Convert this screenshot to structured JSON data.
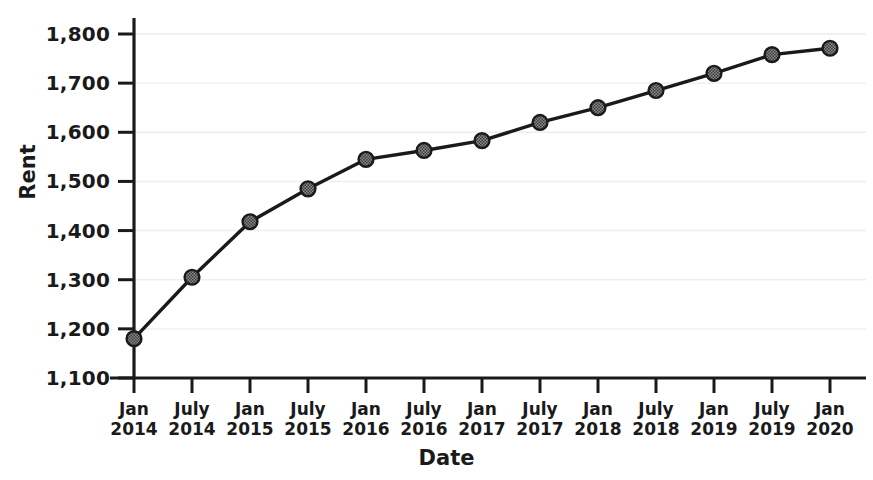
{
  "chart_data": {
    "type": "line",
    "title": "",
    "xlabel": "Date",
    "ylabel": "Rent",
    "categories": [
      "Jan 2014",
      "July 2014",
      "Jan 2015",
      "July 2015",
      "Jan 2016",
      "July 2016",
      "Jan 2017",
      "July 2017",
      "Jan 2018",
      "July 2018",
      "Jan 2019",
      "July 2019",
      "Jan 2020"
    ],
    "x_tick_labels": [
      {
        "line1": "Jan",
        "line2": "2014"
      },
      {
        "line1": "July",
        "line2": "2014"
      },
      {
        "line1": "Jan",
        "line2": "2015"
      },
      {
        "line1": "July",
        "line2": "2015"
      },
      {
        "line1": "Jan",
        "line2": "2016"
      },
      {
        "line1": "July",
        "line2": "2016"
      },
      {
        "line1": "Jan",
        "line2": "2017"
      },
      {
        "line1": "July",
        "line2": "2017"
      },
      {
        "line1": "Jan",
        "line2": "2018"
      },
      {
        "line1": "July",
        "line2": "2018"
      },
      {
        "line1": "Jan",
        "line2": "2019"
      },
      {
        "line1": "July",
        "line2": "2019"
      },
      {
        "line1": "Jan",
        "line2": "2020"
      }
    ],
    "values": [
      1180,
      1305,
      1418,
      1485,
      1545,
      1563,
      1583,
      1620,
      1650,
      1685,
      1720,
      1758,
      1771
    ],
    "y_tick_labels": [
      "1,800",
      "1,700",
      "1,600",
      "1,500",
      "1,400",
      "1,300",
      "1,200",
      "1,100"
    ],
    "y_tick_values": [
      1800,
      1700,
      1600,
      1500,
      1400,
      1300,
      1200,
      1100
    ],
    "ylim": [
      1100,
      1800
    ],
    "grid": true,
    "legend": "none",
    "series": [
      {
        "name": "Rent",
        "values": [
          1180,
          1305,
          1418,
          1485,
          1545,
          1563,
          1583,
          1620,
          1650,
          1685,
          1720,
          1758,
          1771
        ],
        "line_color": "#1a1a1a",
        "marker_fill": "#6e6e6e",
        "marker_edge": "#1a1a1a",
        "marker": "circle"
      }
    ],
    "colors": {
      "axis": "#1a1a1a",
      "grid": "#ededed",
      "background": "#ffffff",
      "text": "#1a1a1a"
    }
  }
}
